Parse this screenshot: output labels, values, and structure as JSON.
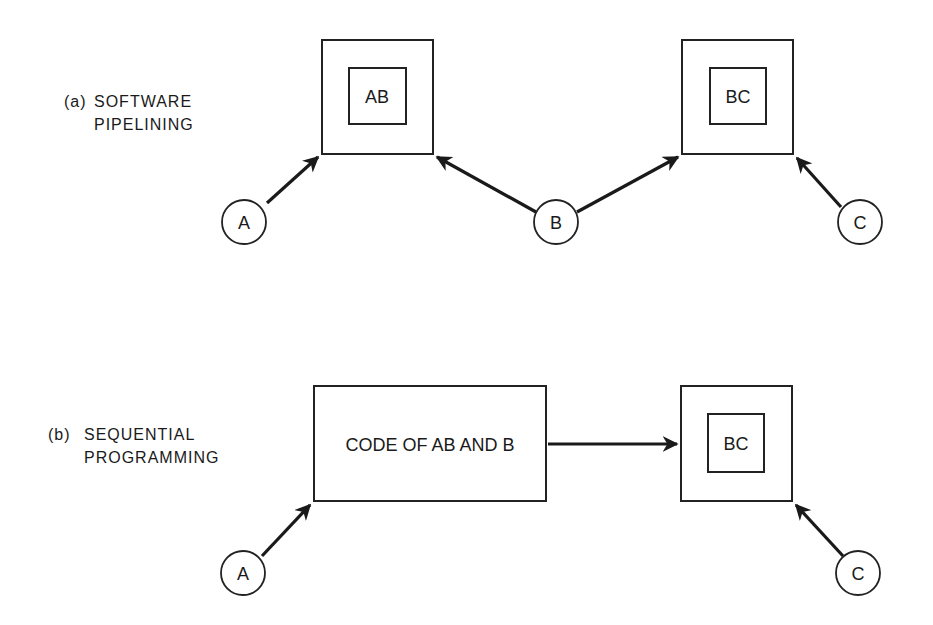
{
  "diagram": {
    "colors": {
      "ink": "#1a1a1a",
      "background": "#ffffff"
    },
    "section_a": {
      "tag": "(a)",
      "title_line1": "SOFTWARE",
      "title_line2": "PIPELINING",
      "boxes": [
        {
          "id": "AB",
          "label": "AB"
        },
        {
          "id": "BC",
          "label": "BC"
        }
      ],
      "nodes": [
        {
          "id": "A",
          "label": "A"
        },
        {
          "id": "B",
          "label": "B"
        },
        {
          "id": "C",
          "label": "C"
        }
      ],
      "edges": [
        {
          "from": "A",
          "to": "AB"
        },
        {
          "from": "B",
          "to": "AB"
        },
        {
          "from": "B",
          "to": "BC"
        },
        {
          "from": "C",
          "to": "BC"
        }
      ]
    },
    "section_b": {
      "tag": "(b)",
      "title_line1": "SEQUENTIAL",
      "title_line2": "PROGRAMMING",
      "boxes": [
        {
          "id": "CODE",
          "label": "CODE OF AB AND B"
        },
        {
          "id": "BC",
          "label": "BC"
        }
      ],
      "nodes": [
        {
          "id": "A",
          "label": "A"
        },
        {
          "id": "C",
          "label": "C"
        }
      ],
      "edges": [
        {
          "from": "A",
          "to": "CODE"
        },
        {
          "from": "CODE",
          "to": "BC"
        },
        {
          "from": "C",
          "to": "BC"
        }
      ]
    }
  }
}
